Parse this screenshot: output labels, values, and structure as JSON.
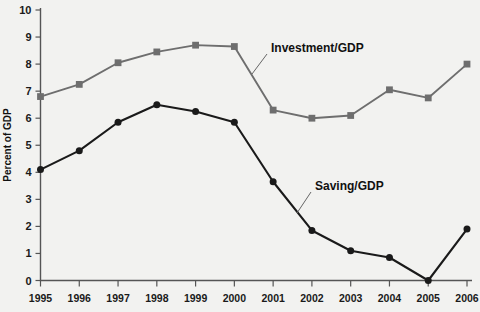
{
  "chart_data": {
    "type": "line",
    "title": "",
    "xlabel": "",
    "ylabel": "Percent of GDP",
    "categories": [
      "1995",
      "1996",
      "1997",
      "1998",
      "1999",
      "2000",
      "2001",
      "2002",
      "2003",
      "2004",
      "2005",
      "2006"
    ],
    "ylim": [
      0,
      10
    ],
    "ytick_values": [
      "0",
      "1",
      "2",
      "3",
      "4",
      "5",
      "6",
      "7",
      "8",
      "9",
      "10"
    ],
    "grid": false,
    "legend_position": "inline-annotation",
    "series": [
      {
        "name": "Investment/GDP",
        "color": "#6e6e6e",
        "marker": "square",
        "values": [
          6.8,
          7.25,
          8.05,
          8.45,
          8.7,
          8.65,
          6.3,
          6.0,
          6.1,
          7.05,
          6.75,
          8.0
        ]
      },
      {
        "name": "Saving/GDP",
        "color": "#1a1a1a",
        "marker": "circle",
        "values": [
          4.1,
          4.8,
          5.85,
          6.5,
          6.25,
          5.85,
          3.65,
          1.85,
          1.1,
          0.85,
          0.0,
          1.9
        ]
      }
    ],
    "annotations": [
      {
        "text": "Investment/GDP",
        "series": "Investment/GDP"
      },
      {
        "text": "Saving/GDP",
        "series": "Saving/GDP"
      }
    ]
  },
  "axes": {
    "y_axis_title": "Percent of GDP"
  },
  "colors": {
    "background": "#f2f2f0",
    "investment": "#6e6e6e",
    "saving": "#1a1a1a",
    "axis": "#555555",
    "text": "#111111"
  }
}
